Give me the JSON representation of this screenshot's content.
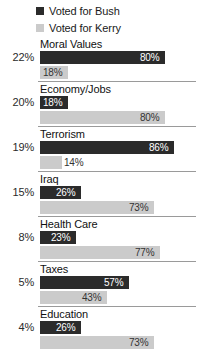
{
  "legend": {
    "items": [
      {
        "label": "Voted for Bush",
        "color": "#2b2b2b",
        "swatch_name": "legend-swatch-bush"
      },
      {
        "label": "Voted for Kerry",
        "color": "#cbcbcb",
        "swatch_name": "legend-swatch-kerry"
      }
    ]
  },
  "chart_data": {
    "type": "bar",
    "title": "",
    "subtitle": "",
    "xlabel": "",
    "ylabel": "",
    "orientation": "horizontal",
    "grid": false,
    "legend_position": "top-left",
    "xlim": [
      0,
      100
    ],
    "value_suffix": "%",
    "categories": [
      "Moral Values",
      "Economy/Jobs",
      "Terrorism",
      "Iraq",
      "Health Care",
      "Taxes",
      "Education"
    ],
    "category_totals": [
      "22%",
      "20%",
      "19%",
      "15%",
      "8%",
      "5%",
      "4%"
    ],
    "series": [
      {
        "name": "Voted for Bush",
        "color": "#2b2b2b",
        "values": [
          80,
          18,
          86,
          26,
          23,
          57,
          26
        ]
      },
      {
        "name": "Voted for Kerry",
        "color": "#cbcbcb",
        "values": [
          18,
          80,
          14,
          73,
          77,
          43,
          73
        ]
      }
    ],
    "groups": [
      {
        "category": "Moral Values",
        "total": "22%",
        "bars": [
          {
            "series": "Voted for Bush",
            "value": 80,
            "label": "80%"
          },
          {
            "series": "Voted for Kerry",
            "value": 18,
            "label": "18%"
          }
        ]
      },
      {
        "category": "Economy/Jobs",
        "total": "20%",
        "bars": [
          {
            "series": "Voted for Bush",
            "value": 18,
            "label": "18%"
          },
          {
            "series": "Voted for Kerry",
            "value": 80,
            "label": "80%"
          }
        ]
      },
      {
        "category": "Terrorism",
        "total": "19%",
        "bars": [
          {
            "series": "Voted for Bush",
            "value": 86,
            "label": "86%"
          },
          {
            "series": "Voted for Kerry",
            "value": 14,
            "label": "14%"
          }
        ]
      },
      {
        "category": "Iraq",
        "total": "15%",
        "bars": [
          {
            "series": "Voted for Bush",
            "value": 26,
            "label": "26%"
          },
          {
            "series": "Voted for Kerry",
            "value": 73,
            "label": "73%"
          }
        ]
      },
      {
        "category": "Health Care",
        "total": "8%",
        "bars": [
          {
            "series": "Voted for Bush",
            "value": 23,
            "label": "23%"
          },
          {
            "series": "Voted for Kerry",
            "value": 77,
            "label": "77%"
          }
        ]
      },
      {
        "category": "Taxes",
        "total": "5%",
        "bars": [
          {
            "series": "Voted for Bush",
            "value": 57,
            "label": "57%"
          },
          {
            "series": "Voted for Kerry",
            "value": 43,
            "label": "43%"
          }
        ]
      },
      {
        "category": "Education",
        "total": "4%",
        "bars": [
          {
            "series": "Voted for Bush",
            "value": 26,
            "label": "26%"
          },
          {
            "series": "Voted for Kerry",
            "value": 73,
            "label": "73%"
          }
        ]
      }
    ]
  }
}
